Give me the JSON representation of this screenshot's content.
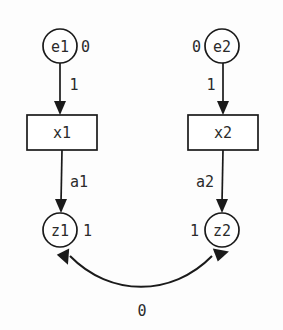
{
  "diagram": {
    "background_color": "#fdfdfd",
    "stroke_color": "#1a1a1a",
    "text_color": "#2b2b2b",
    "nodes": [
      {
        "id": "e1",
        "label": "e1",
        "shape": "circle",
        "cx": 60,
        "cy": 46,
        "r": 17,
        "annotation": "0",
        "annotation_side": "right"
      },
      {
        "id": "e2",
        "label": "e2",
        "shape": "circle",
        "cx": 222,
        "cy": 46,
        "r": 17,
        "annotation": "0",
        "annotation_side": "left"
      },
      {
        "id": "x1",
        "label": "x1",
        "shape": "rect",
        "cx": 62,
        "cy": 132,
        "w": 70,
        "h": 35,
        "annotation": "",
        "annotation_side": "none"
      },
      {
        "id": "x2",
        "label": "x2",
        "shape": "rect",
        "cx": 223,
        "cy": 132,
        "w": 70,
        "h": 35,
        "annotation": "",
        "annotation_side": "none"
      },
      {
        "id": "z1",
        "label": "z1",
        "shape": "circle",
        "cx": 60,
        "cy": 230,
        "r": 17,
        "annotation": "1",
        "annotation_side": "right"
      },
      {
        "id": "z2",
        "label": "z2",
        "shape": "circle",
        "cx": 222,
        "cy": 230,
        "r": 17,
        "annotation": "1",
        "annotation_side": "left"
      }
    ],
    "edges": [
      {
        "id": "e1-x1",
        "from": "e1",
        "to": "x1",
        "label": "1",
        "label_x": 74,
        "label_y": 85,
        "style": "straight",
        "direction": "down"
      },
      {
        "id": "e2-x2",
        "from": "e2",
        "to": "x2",
        "label": "1",
        "label_x": 211,
        "label_y": 85,
        "style": "straight",
        "direction": "down"
      },
      {
        "id": "x1-z1",
        "from": "x1",
        "to": "z1",
        "label": "a1",
        "label_x": 79,
        "label_y": 182,
        "style": "straight",
        "direction": "down"
      },
      {
        "id": "x2-z2",
        "from": "x2",
        "to": "z2",
        "label": "a2",
        "label_x": 205,
        "label_y": 182,
        "style": "straight",
        "direction": "down"
      },
      {
        "id": "z1-z2",
        "from": "z1",
        "to": "z2",
        "label": "0",
        "label_x": 142,
        "label_y": 311,
        "style": "curved",
        "direction": "both"
      }
    ]
  }
}
